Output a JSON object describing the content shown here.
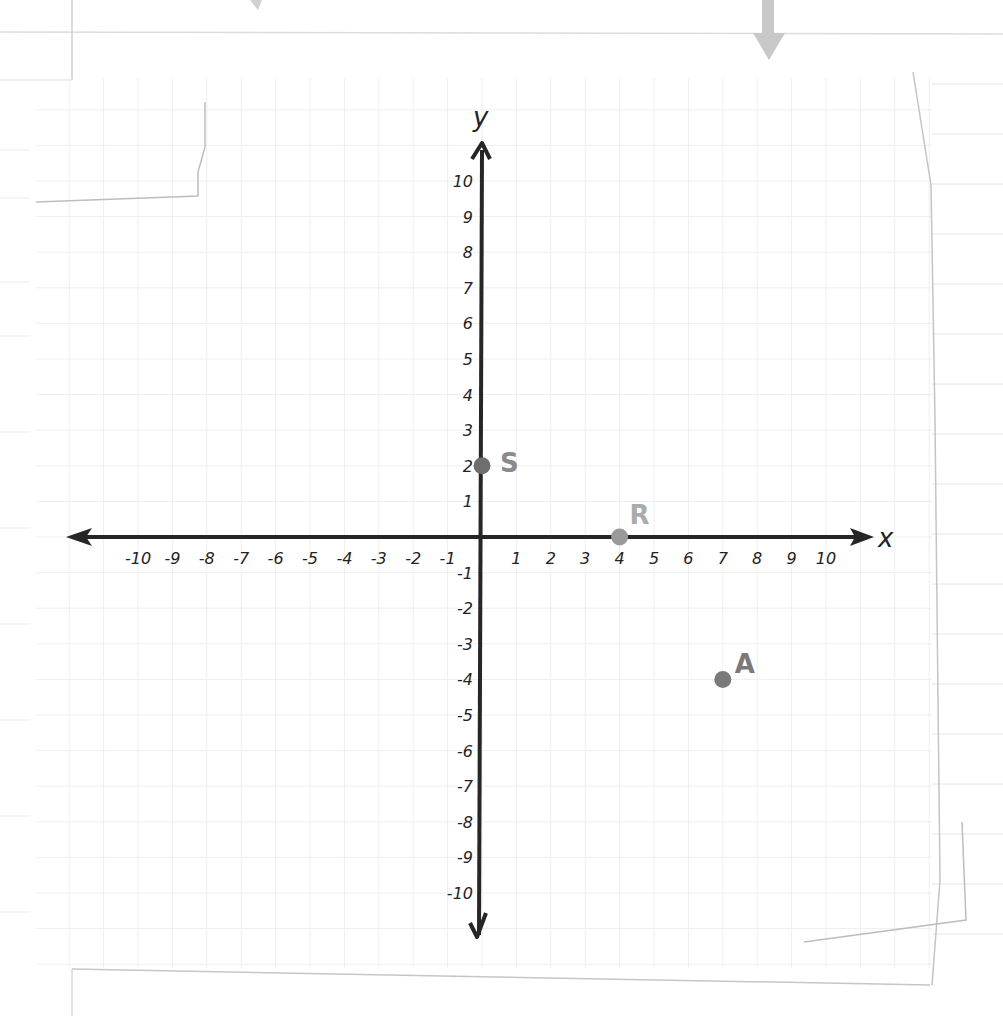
{
  "chart_data": {
    "type": "scatter",
    "title": "",
    "xlabel": "x",
    "ylabel": "y",
    "xlim": [
      -10,
      10
    ],
    "ylim": [
      -10,
      10
    ],
    "grid": true,
    "x_ticks": [
      -10,
      -9,
      -8,
      -7,
      -6,
      -5,
      -4,
      -3,
      -2,
      -1,
      1,
      2,
      3,
      4,
      5,
      6,
      7,
      8,
      9,
      10
    ],
    "y_ticks": [
      10,
      9,
      8,
      7,
      6,
      5,
      4,
      3,
      2,
      1,
      -1,
      -2,
      -3,
      -4,
      -5,
      -6,
      -7,
      -8,
      -9,
      -10
    ],
    "x_tick_labels": [
      "-10",
      "-9",
      "-8",
      "-7",
      "-6",
      "-5",
      "-4",
      "-3",
      "-2",
      "-1",
      "1",
      "2",
      "3",
      "4",
      "5",
      "6",
      "7",
      "8",
      "9",
      "10"
    ],
    "y_tick_labels": [
      "10",
      "9",
      "8",
      "7",
      "6",
      "5",
      "4",
      "3",
      "2",
      "1",
      "-1",
      "-2",
      "-3",
      "-4",
      "-5",
      "-6",
      "-7",
      "-8",
      "-9",
      "-10"
    ],
    "points": [
      {
        "label": "S",
        "x": 0,
        "y": 2,
        "color": "#6e6e6e",
        "label_color": "#8a8a8a"
      },
      {
        "label": "R",
        "x": 4,
        "y": 0,
        "color": "#9a9a9a",
        "label_color": "#ababab"
      },
      {
        "label": "A",
        "x": 7,
        "y": -4,
        "color": "#7a7a7a",
        "label_color": "#7a7a7a"
      }
    ]
  },
  "colors": {
    "axis": "#262626",
    "grid": "#eeeeee",
    "paper_edge": "#c4c4c4",
    "arrow_hint": "#c8c8c8"
  }
}
